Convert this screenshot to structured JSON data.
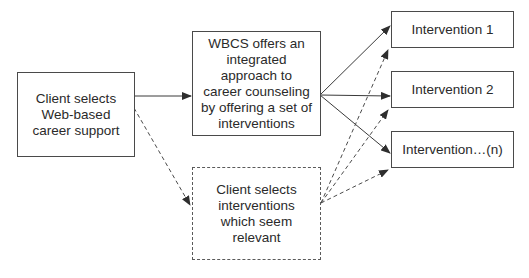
{
  "diagram": {
    "nodes": {
      "client_selects_web": {
        "label": "Client selects\nWeb-based\ncareer support",
        "style": "solid"
      },
      "wbcs_offers": {
        "label": "WBCS offers an\nintegrated\napproach to\ncareer counseling\nby offering a set of\ninterventions",
        "style": "solid"
      },
      "client_selects_interventions": {
        "label": "Client selects\ninterventions\nwhich seem\nrelevant",
        "style": "dashed"
      },
      "intervention_1": {
        "label": "Intervention 1",
        "style": "solid"
      },
      "intervention_2": {
        "label": "Intervention 2",
        "style": "solid"
      },
      "intervention_n": {
        "label": "Intervention…(n)",
        "style": "solid"
      }
    },
    "edges": [
      {
        "from": "client_selects_web",
        "to": "wbcs_offers",
        "style": "solid"
      },
      {
        "from": "client_selects_web",
        "to": "client_selects_interventions",
        "style": "dashed"
      },
      {
        "from": "wbcs_offers",
        "to": "intervention_1",
        "style": "solid"
      },
      {
        "from": "wbcs_offers",
        "to": "intervention_2",
        "style": "solid"
      },
      {
        "from": "wbcs_offers",
        "to": "intervention_n",
        "style": "solid"
      },
      {
        "from": "client_selects_interventions",
        "to": "intervention_1",
        "style": "dashed"
      },
      {
        "from": "client_selects_interventions",
        "to": "intervention_2",
        "style": "dashed"
      },
      {
        "from": "client_selects_interventions",
        "to": "intervention_n",
        "style": "dashed"
      }
    ],
    "colors": {
      "line": "#3a3a3a",
      "text": "#2a2a2a",
      "background": "#ffffff"
    }
  }
}
